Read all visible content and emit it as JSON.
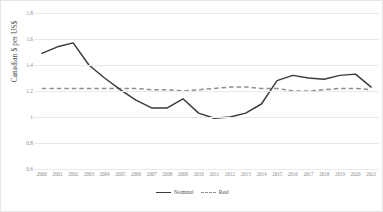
{
  "chart_data": {
    "type": "line",
    "title": "",
    "xlabel": "",
    "ylabel": "Canadian $ per US$",
    "ylim": [
      0.6,
      1.8
    ],
    "yticks": [
      "1.8",
      "1.6",
      "1.4",
      "1.2",
      "1",
      "0.8",
      "0.6"
    ],
    "ytick_values": [
      1.8,
      1.6,
      1.4,
      1.2,
      1.0,
      0.8,
      0.6
    ],
    "grid": true,
    "legend_position": "bottom-center",
    "categories": [
      "2000",
      "2001",
      "2002",
      "2003",
      "2004",
      "2005",
      "2006",
      "2007",
      "2008",
      "2009",
      "2010",
      "2011",
      "2012",
      "2013",
      "2014",
      "2015",
      "2016",
      "2017",
      "2018",
      "2019",
      "2020",
      "2021"
    ],
    "series": [
      {
        "name": "Nominal",
        "style": "solid",
        "color": "#3a3a3a",
        "values": [
          1.49,
          1.54,
          1.57,
          1.4,
          1.3,
          1.21,
          1.13,
          1.07,
          1.07,
          1.14,
          1.03,
          0.99,
          1.0,
          1.03,
          1.1,
          1.28,
          1.32,
          1.3,
          1.29,
          1.32,
          1.33,
          1.23
        ]
      },
      {
        "name": "Real",
        "style": "dashed",
        "color": "#8f8f8f",
        "values": [
          1.22,
          1.22,
          1.22,
          1.22,
          1.22,
          1.22,
          1.22,
          1.21,
          1.21,
          1.2,
          1.21,
          1.22,
          1.23,
          1.23,
          1.22,
          1.22,
          1.2,
          1.2,
          1.21,
          1.22,
          1.22,
          1.21
        ]
      }
    ]
  },
  "legend": {
    "items": [
      {
        "label": "Nominal"
      },
      {
        "label": "Real"
      }
    ]
  },
  "colors": {
    "nominal": "#3a3a3a",
    "real": "#8f8f8f",
    "gridline": "#e9e9e9",
    "axis_text": "#8c8c8c",
    "title_text": "#4a4a4a",
    "background": "#ffffff",
    "border": "#e6e6e6"
  }
}
